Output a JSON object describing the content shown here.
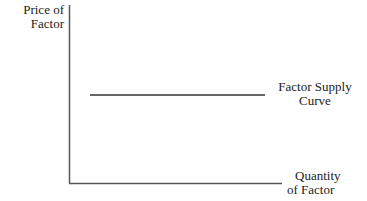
{
  "diagram": {
    "type": "economics-factor-supply",
    "y_axis": {
      "label_lines": [
        "Price of",
        "Factor"
      ]
    },
    "x_axis": {
      "label_lines": [
        "Quantity",
        "of Factor"
      ]
    },
    "curves": [
      {
        "name": "Factor Supply Curve",
        "shape": "horizontal",
        "label_lines": [
          "Factor Supply",
          "Curve"
        ]
      }
    ],
    "colors": {
      "axis": "#555555",
      "curve": "#333333",
      "text": "#222222"
    }
  }
}
